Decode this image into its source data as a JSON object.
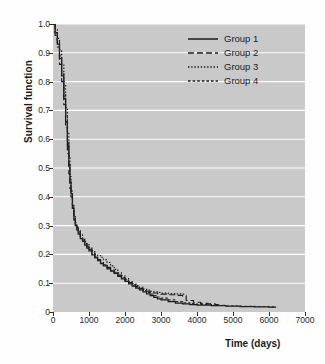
{
  "chart_data": {
    "type": "line",
    "title": "",
    "xlabel": "Time (days)",
    "ylabel": "Survival function",
    "xlim": [
      0,
      7000
    ],
    "ylim": [
      0,
      1.0
    ],
    "xticks": [
      0,
      1000,
      2000,
      3000,
      4000,
      5000,
      6000,
      7000
    ],
    "xtick_labels": [
      "0",
      "1000",
      "2000",
      "3000",
      "4000",
      "5000",
      "6000",
      "7000"
    ],
    "yticks": [
      0,
      0.1,
      0.2,
      0.3,
      0.4,
      0.5,
      0.6,
      0.7,
      0.8,
      0.9,
      1.0
    ],
    "ytick_labels": [
      "0",
      "0.1",
      "0.2",
      "0.3",
      "0.4",
      "0.5",
      "0.6",
      "0.7",
      "0.8",
      "0.9",
      "1.0"
    ],
    "grid": "horizontal-white",
    "plot_background": "#c9c9c9",
    "figure_background": "#ffffff",
    "legend_position": "top-right",
    "series": [
      {
        "name": "Group 1",
        "style": "solid",
        "color": "#1a1a1a",
        "points": [
          [
            0,
            1.0
          ],
          [
            60,
            0.97
          ],
          [
            120,
            0.93
          ],
          [
            180,
            0.88
          ],
          [
            240,
            0.82
          ],
          [
            300,
            0.74
          ],
          [
            350,
            0.66
          ],
          [
            400,
            0.58
          ],
          [
            440,
            0.51
          ],
          [
            470,
            0.45
          ],
          [
            500,
            0.41
          ],
          [
            540,
            0.36
          ],
          [
            580,
            0.32
          ],
          [
            620,
            0.3
          ],
          [
            660,
            0.285
          ],
          [
            700,
            0.27
          ],
          [
            760,
            0.255
          ],
          [
            820,
            0.245
          ],
          [
            880,
            0.232
          ],
          [
            940,
            0.222
          ],
          [
            1000,
            0.212
          ],
          [
            1080,
            0.198
          ],
          [
            1160,
            0.188
          ],
          [
            1240,
            0.178
          ],
          [
            1320,
            0.168
          ],
          [
            1400,
            0.16
          ],
          [
            1500,
            0.15
          ],
          [
            1600,
            0.142
          ],
          [
            1700,
            0.134
          ],
          [
            1800,
            0.124
          ],
          [
            1900,
            0.115
          ],
          [
            2000,
            0.106
          ],
          [
            2100,
            0.098
          ],
          [
            2200,
            0.09
          ],
          [
            2300,
            0.083
          ],
          [
            2400,
            0.077
          ],
          [
            2500,
            0.07
          ],
          [
            2600,
            0.063
          ],
          [
            2700,
            0.057
          ],
          [
            2800,
            0.051
          ],
          [
            2900,
            0.046
          ],
          [
            3000,
            0.042
          ],
          [
            3200,
            0.036
          ],
          [
            3400,
            0.031
          ],
          [
            3600,
            0.028
          ],
          [
            3800,
            0.026
          ],
          [
            4000,
            0.024
          ],
          [
            4400,
            0.022
          ],
          [
            4800,
            0.02
          ],
          [
            5200,
            0.019
          ],
          [
            5600,
            0.018
          ],
          [
            6000,
            0.017
          ],
          [
            6200,
            0.017
          ]
        ]
      },
      {
        "name": "Group 2",
        "style": "dashed",
        "color": "#1a1a1a",
        "points": [
          [
            0,
            1.0
          ],
          [
            60,
            0.96
          ],
          [
            120,
            0.92
          ],
          [
            180,
            0.86
          ],
          [
            240,
            0.8
          ],
          [
            300,
            0.72
          ],
          [
            350,
            0.64
          ],
          [
            400,
            0.55
          ],
          [
            440,
            0.48
          ],
          [
            470,
            0.43
          ],
          [
            500,
            0.4
          ],
          [
            540,
            0.355
          ],
          [
            580,
            0.325
          ],
          [
            620,
            0.305
          ],
          [
            660,
            0.292
          ],
          [
            700,
            0.278
          ],
          [
            760,
            0.262
          ],
          [
            820,
            0.25
          ],
          [
            880,
            0.238
          ],
          [
            940,
            0.228
          ],
          [
            1000,
            0.218
          ],
          [
            1080,
            0.205
          ],
          [
            1160,
            0.192
          ],
          [
            1240,
            0.182
          ],
          [
            1320,
            0.172
          ],
          [
            1400,
            0.164
          ],
          [
            1500,
            0.155
          ],
          [
            1600,
            0.146
          ],
          [
            1700,
            0.138
          ],
          [
            1800,
            0.128
          ],
          [
            1900,
            0.12
          ],
          [
            2000,
            0.112
          ],
          [
            2100,
            0.102
          ],
          [
            2200,
            0.094
          ],
          [
            2300,
            0.088
          ],
          [
            2400,
            0.082
          ],
          [
            2500,
            0.076
          ],
          [
            2600,
            0.072
          ],
          [
            2700,
            0.068
          ],
          [
            2800,
            0.066
          ],
          [
            2900,
            0.064
          ],
          [
            3000,
            0.062
          ],
          [
            3200,
            0.06
          ],
          [
            3400,
            0.058
          ],
          [
            3600,
            0.056
          ],
          [
            3700,
            0.04
          ],
          [
            3900,
            0.034
          ],
          [
            4100,
            0.03
          ],
          [
            4300,
            0.028
          ],
          [
            4500,
            0.026
          ],
          [
            4600,
            0.026
          ]
        ]
      },
      {
        "name": "Group 3",
        "style": "dotted",
        "color": "#1a1a1a",
        "points": [
          [
            0,
            1.0
          ],
          [
            60,
            0.98
          ],
          [
            120,
            0.95
          ],
          [
            180,
            0.91
          ],
          [
            240,
            0.86
          ],
          [
            300,
            0.79
          ],
          [
            350,
            0.71
          ],
          [
            400,
            0.62
          ],
          [
            440,
            0.54
          ],
          [
            470,
            0.47
          ],
          [
            500,
            0.42
          ],
          [
            540,
            0.37
          ],
          [
            580,
            0.335
          ],
          [
            620,
            0.31
          ],
          [
            660,
            0.295
          ],
          [
            700,
            0.282
          ],
          [
            760,
            0.268
          ],
          [
            820,
            0.256
          ],
          [
            880,
            0.244
          ],
          [
            940,
            0.234
          ],
          [
            1000,
            0.224
          ],
          [
            1080,
            0.212
          ],
          [
            1160,
            0.2
          ],
          [
            1240,
            0.196
          ],
          [
            1320,
            0.19
          ],
          [
            1400,
            0.182
          ],
          [
            1500,
            0.172
          ],
          [
            1600,
            0.16
          ],
          [
            1700,
            0.148
          ],
          [
            1800,
            0.136
          ],
          [
            1900,
            0.126
          ],
          [
            2000,
            0.116
          ],
          [
            2100,
            0.106
          ],
          [
            2200,
            0.098
          ],
          [
            2300,
            0.092
          ],
          [
            2400,
            0.086
          ],
          [
            2500,
            0.08
          ],
          [
            2600,
            0.076
          ],
          [
            2700,
            0.072
          ],
          [
            2800,
            0.07
          ],
          [
            2900,
            0.068
          ],
          [
            3000,
            0.066
          ],
          [
            3200,
            0.064
          ],
          [
            3400,
            0.063
          ],
          [
            3600,
            0.062
          ],
          [
            3700,
            0.062
          ]
        ]
      },
      {
        "name": "Group 4",
        "style": "short-dash",
        "color": "#2a2a2a",
        "points": [
          [
            0,
            1.0
          ],
          [
            60,
            0.97
          ],
          [
            120,
            0.94
          ],
          [
            180,
            0.89
          ],
          [
            240,
            0.83
          ],
          [
            300,
            0.76
          ],
          [
            350,
            0.68
          ],
          [
            400,
            0.59
          ],
          [
            440,
            0.52
          ],
          [
            470,
            0.46
          ],
          [
            500,
            0.415
          ],
          [
            540,
            0.365
          ],
          [
            580,
            0.33
          ],
          [
            620,
            0.302
          ],
          [
            660,
            0.288
          ],
          [
            700,
            0.274
          ],
          [
            760,
            0.258
          ],
          [
            820,
            0.246
          ],
          [
            880,
            0.236
          ],
          [
            940,
            0.226
          ],
          [
            1000,
            0.216
          ],
          [
            1080,
            0.202
          ],
          [
            1160,
            0.19
          ],
          [
            1240,
            0.18
          ],
          [
            1320,
            0.17
          ],
          [
            1400,
            0.162
          ],
          [
            1500,
            0.152
          ],
          [
            1600,
            0.144
          ],
          [
            1700,
            0.136
          ],
          [
            1800,
            0.126
          ],
          [
            1900,
            0.118
          ],
          [
            2000,
            0.11
          ],
          [
            2100,
            0.1
          ],
          [
            2200,
            0.092
          ],
          [
            2300,
            0.086
          ],
          [
            2400,
            0.08
          ],
          [
            2500,
            0.074
          ],
          [
            2600,
            0.068
          ],
          [
            2700,
            0.062
          ],
          [
            2800,
            0.057
          ],
          [
            2900,
            0.052
          ],
          [
            3000,
            0.048
          ],
          [
            3200,
            0.042
          ],
          [
            3400,
            0.036
          ],
          [
            3600,
            0.032
          ],
          [
            3800,
            0.029
          ],
          [
            4000,
            0.026
          ],
          [
            4400,
            0.023
          ],
          [
            4800,
            0.021
          ],
          [
            5200,
            0.02
          ],
          [
            5600,
            0.019
          ],
          [
            6000,
            0.018
          ],
          [
            6200,
            0.018
          ]
        ]
      }
    ],
    "legend": [
      {
        "label": "Group 1",
        "style": "solid"
      },
      {
        "label": "Group 2",
        "style": "dashed"
      },
      {
        "label": "Group 3",
        "style": "dotted"
      },
      {
        "label": "Group 4",
        "style": "short-dash"
      }
    ]
  }
}
